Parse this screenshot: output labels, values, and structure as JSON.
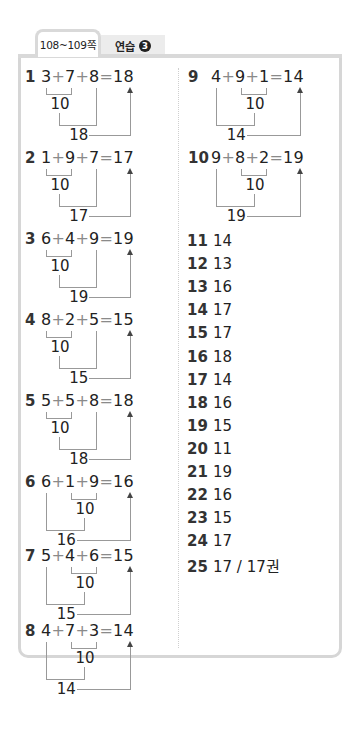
{
  "tabs": {
    "pages_label": "108~109쪽",
    "practice_label": "연습",
    "practice_number": "3"
  },
  "diagram_problems": [
    {
      "no": "1",
      "a": "3",
      "b": "7",
      "c": "8",
      "result": "18",
      "first_sum": "10",
      "second_sum": "18",
      "pair": "ab"
    },
    {
      "no": "2",
      "a": "1",
      "b": "9",
      "c": "7",
      "result": "17",
      "first_sum": "10",
      "second_sum": "17",
      "pair": "ab"
    },
    {
      "no": "3",
      "a": "6",
      "b": "4",
      "c": "9",
      "result": "19",
      "first_sum": "10",
      "second_sum": "19",
      "pair": "ab"
    },
    {
      "no": "4",
      "a": "8",
      "b": "2",
      "c": "5",
      "result": "15",
      "first_sum": "10",
      "second_sum": "15",
      "pair": "ab"
    },
    {
      "no": "5",
      "a": "5",
      "b": "5",
      "c": "8",
      "result": "18",
      "first_sum": "10",
      "second_sum": "18",
      "pair": "ab"
    },
    {
      "no": "6",
      "a": "6",
      "b": "1",
      "c": "9",
      "result": "16",
      "first_sum": "10",
      "second_sum": "16",
      "pair": "bc"
    },
    {
      "no": "7",
      "a": "5",
      "b": "4",
      "c": "6",
      "result": "15",
      "first_sum": "10",
      "second_sum": "15",
      "pair": "bc"
    },
    {
      "no": "8",
      "a": "4",
      "b": "7",
      "c": "3",
      "result": "14",
      "first_sum": "10",
      "second_sum": "14",
      "pair": "bc"
    },
    {
      "no": "9",
      "a": "4",
      "b": "9",
      "c": "1",
      "result": "14",
      "first_sum": "10",
      "second_sum": "14",
      "pair": "bc"
    },
    {
      "no": "10",
      "a": "9",
      "b": "8",
      "c": "2",
      "result": "19",
      "first_sum": "10",
      "second_sum": "19",
      "pair": "bc"
    }
  ],
  "symbols": {
    "plus": "+",
    "equals": "="
  },
  "answers": [
    {
      "no": "11",
      "value": "14"
    },
    {
      "no": "12",
      "value": "13"
    },
    {
      "no": "13",
      "value": "16"
    },
    {
      "no": "14",
      "value": "17"
    },
    {
      "no": "15",
      "value": "17"
    },
    {
      "no": "16",
      "value": "18"
    },
    {
      "no": "17",
      "value": "14"
    },
    {
      "no": "18",
      "value": "16"
    },
    {
      "no": "19",
      "value": "15"
    },
    {
      "no": "20",
      "value": "11"
    },
    {
      "no": "21",
      "value": "19"
    },
    {
      "no": "22",
      "value": "16"
    },
    {
      "no": "23",
      "value": "15"
    },
    {
      "no": "24",
      "value": "17"
    },
    {
      "no": "25",
      "value": "17 / 17권"
    }
  ]
}
